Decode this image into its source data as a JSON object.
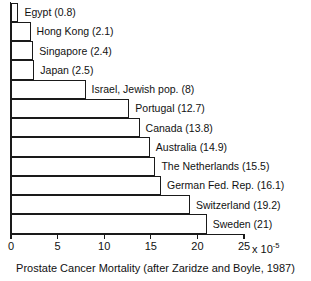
{
  "chart_data": {
    "type": "bar",
    "orientation": "horizontal",
    "title": "",
    "caption": "Prostate Cancer Mortality (after Zaridze and Boyle, 1987)",
    "xlabel": "",
    "ylabel": "",
    "unit_text": "x 10",
    "unit_exponent": "-5",
    "xlim": [
      0,
      25
    ],
    "xticks": [
      0,
      5,
      10,
      15,
      20,
      25
    ],
    "xtick_labels": [
      "0",
      "5",
      "10",
      "15",
      "20",
      "25"
    ],
    "grid": false,
    "legend": false,
    "categories": [
      "Egypt",
      "Hong Kong",
      "Singapore",
      "Japan",
      "Israel, Jewish pop.",
      "Portugal",
      "Canada",
      "Australia",
      "The Netherlands",
      "German Fed. Rep.",
      "Switzerland",
      "Sweden"
    ],
    "values": [
      0.8,
      2.1,
      2.4,
      2.5,
      8,
      12.7,
      13.8,
      14.9,
      15.5,
      16.1,
      19.2,
      21
    ],
    "bar_labels": [
      "Egypt (0.8)",
      "Hong Kong (2.1)",
      "Singapore (2.4)",
      "Japan (2.5)",
      "Israel, Jewish pop. (8)",
      "Portugal (12.7)",
      "Canada (13.8)",
      "Australia (14.9)",
      "The Netherlands (15.5)",
      "German Fed. Rep. (16.1)",
      "Switzerland (19.2)",
      "Sweden (21)"
    ],
    "colors": {
      "bar_fill": "#ffffff",
      "bar_stroke": "#1a1a1a",
      "axis": "#1a1a1a",
      "text": "#111111",
      "background": "#ffffff"
    }
  }
}
